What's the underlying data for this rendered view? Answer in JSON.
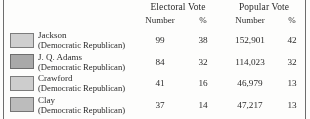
{
  "table": {
    "column_groups": [
      {
        "label": "Electoral Vote"
      },
      {
        "label": "Popular Vote"
      }
    ],
    "sub_headers": {
      "electoral_number": "Number",
      "electoral_percent": "%",
      "popular_number": "Number",
      "popular_percent": "%"
    },
    "rows": [
      {
        "candidate": "Jackson",
        "party": "(Democratic Republican)",
        "swatch_color": "#cfcfcf",
        "swatch_border": "#7c7c7c",
        "electoral_number": "99",
        "electoral_percent": "38",
        "popular_number": "152,901",
        "popular_percent": "42"
      },
      {
        "candidate": "J. Q. Adams",
        "party": "(Democratic Republican)",
        "swatch_color": "#a9a9a9",
        "swatch_border": "#6e6e6e",
        "electoral_number": "84",
        "electoral_percent": "32",
        "popular_number": "114,023",
        "popular_percent": "32"
      },
      {
        "candidate": "Crawford",
        "party": "(Democratic Republican)",
        "swatch_color": "#cdcdcd",
        "swatch_border": "#7c7c7c",
        "electoral_number": "41",
        "electoral_percent": "16",
        "popular_number": "46,979",
        "popular_percent": "13"
      },
      {
        "candidate": "Clay",
        "party": "(Democratic Republican)",
        "swatch_color": "#bcbcbc",
        "swatch_border": "#757575",
        "electoral_number": "37",
        "electoral_percent": "14",
        "popular_number": "47,217",
        "popular_percent": "13"
      }
    ]
  },
  "chart_data": {
    "type": "table",
    "title": "",
    "columns": [
      "Candidate",
      "Electoral Vote Number",
      "Electoral Vote %",
      "Popular Vote Number",
      "Popular Vote %"
    ],
    "rows": [
      [
        "Jackson (Democratic Republican)",
        99,
        38,
        152901,
        42
      ],
      [
        "J. Q. Adams (Democratic Republican)",
        84,
        32,
        114023,
        32
      ],
      [
        "Crawford (Democratic Republican)",
        41,
        16,
        46979,
        13
      ],
      [
        "Clay (Democratic Republican)",
        37,
        14,
        47217,
        13
      ]
    ],
    "legend": [
      {
        "label": "Jackson",
        "color": "#cfcfcf"
      },
      {
        "label": "J. Q. Adams",
        "color": "#a9a9a9"
      },
      {
        "label": "Crawford",
        "color": "#cdcdcd"
      },
      {
        "label": "Clay",
        "color": "#bcbcbc"
      }
    ]
  }
}
